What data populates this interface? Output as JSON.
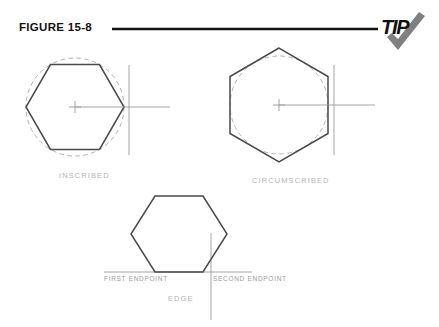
{
  "figure": {
    "title": "FIGURE 15-8",
    "rule_color": "#111111"
  },
  "logo": {
    "word": "TIP",
    "check_icon": "check-icon",
    "word_color": "#111111",
    "check_color": "#808080"
  },
  "colors": {
    "hexagon_stroke": "#4a4a4a",
    "construction_line": "#9a9a9a",
    "dashed_circle": "#a8a8a8",
    "caption_text": "#b4b4b4",
    "label_text": "#9a9a9a",
    "background": "#ffffff"
  },
  "diagrams": [
    {
      "id": "inscribed",
      "caption": "INSCRIBED",
      "shape": "hexagon",
      "orientation": "flat-top",
      "circle_relation": "circumscribing-dashed-circle",
      "center": {
        "x": 75,
        "y": 107
      },
      "radius": 49,
      "rotation_deg": 0,
      "has_center_mark": true,
      "has_radius_line": true,
      "has_vertical_tangent": true
    },
    {
      "id": "circumscribed",
      "caption": "CIRCUMSCRIBED",
      "shape": "hexagon",
      "orientation": "pointy-top",
      "circle_relation": "inscribed-dashed-circle",
      "center": {
        "x": 279,
        "y": 105
      },
      "radius": 57,
      "rotation_deg": 30,
      "has_center_mark": true,
      "has_radius_line": true,
      "has_vertical_tangent": true
    },
    {
      "id": "edge",
      "caption": "EDGE",
      "shape": "hexagon",
      "orientation": "flat-top",
      "circle_relation": "none",
      "center": {
        "x": 179,
        "y": 234
      },
      "radius": 48,
      "rotation_deg": 0,
      "has_center_mark": false,
      "has_baseline": true,
      "has_vertical_line": true,
      "endpoints": {
        "first": "FIRST ENDPOINT",
        "second": "SECOND ENDPOINT"
      }
    }
  ]
}
